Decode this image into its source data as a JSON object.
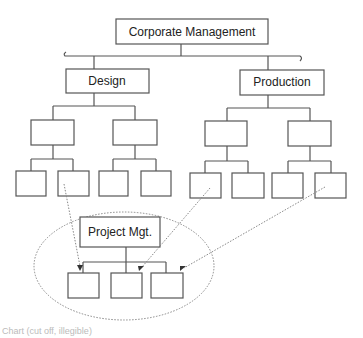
{
  "diagram": {
    "type": "organization-chart",
    "top": {
      "label": "Corporate Management"
    },
    "divisions": [
      {
        "label": "Design"
      },
      {
        "label": "Production"
      }
    ],
    "project": {
      "label": "Project Mgt."
    },
    "caption": "Chart (cut off, illegible)"
  }
}
